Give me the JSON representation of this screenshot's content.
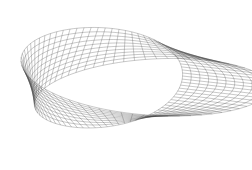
{
  "figure": {
    "background": "#ffffff",
    "line_color": "#3a3a3a",
    "line_opacity": 0.55,
    "u_segments": 72,
    "v_segments": 10,
    "radius": 1.0,
    "half_width": 0.45,
    "view": {
      "rot_x_deg": 62,
      "rot_z_deg": -18,
      "scale": 98,
      "cx": 128,
      "cy": 82
    }
  }
}
